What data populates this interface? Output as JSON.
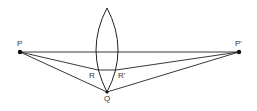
{
  "diagram": {
    "labels": {
      "P": "P",
      "P_prime": "P'",
      "Q": "Q",
      "R": "R",
      "R_prime": "R'"
    },
    "points": {
      "P": [
        20,
        52
      ],
      "P_prime": [
        239,
        52
      ],
      "Q": [
        107,
        92
      ],
      "R": [
        98,
        70
      ],
      "R_prime": [
        116,
        70
      ],
      "lens_top": [
        107,
        8
      ],
      "lens_bottom": [
        107,
        92
      ]
    },
    "colors": {
      "line": "#222222",
      "background": "#ffffff"
    }
  }
}
